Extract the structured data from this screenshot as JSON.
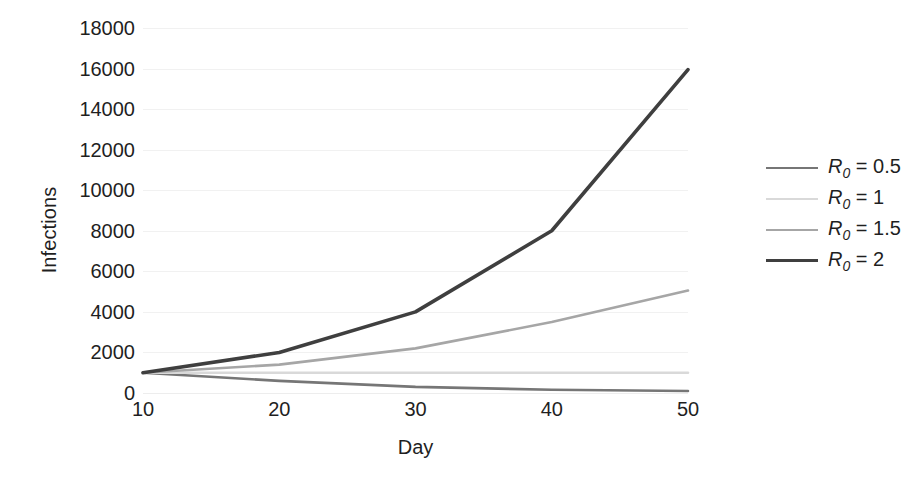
{
  "chart_data": {
    "type": "line",
    "title": "",
    "xlabel": "Day",
    "ylabel": "Infections",
    "x": [
      10,
      20,
      30,
      40,
      50
    ],
    "xlim": [
      10,
      50
    ],
    "ylim": [
      0,
      18000
    ],
    "x_ticks": [
      "10",
      "20",
      "30",
      "40",
      "50"
    ],
    "y_ticks": [
      "0",
      "2000",
      "4000",
      "6000",
      "8000",
      "10000",
      "12000",
      "14000",
      "16000",
      "18000"
    ],
    "y_tick_values": [
      0,
      2000,
      4000,
      6000,
      8000,
      10000,
      12000,
      14000,
      16000,
      18000
    ],
    "grid": true,
    "legend_position": "right",
    "series": [
      {
        "name": "R0 = 0.5",
        "label_prefix": "R",
        "label_sub": "0",
        "label_suffix": " = 0.5",
        "color": "#767676",
        "width": 2.6,
        "values": [
          1000,
          600,
          300,
          160,
          100
        ]
      },
      {
        "name": "R0 = 1",
        "label_prefix": "R",
        "label_sub": "0",
        "label_suffix": " = 1",
        "color": "#d9d9d9",
        "width": 2.6,
        "values": [
          1000,
          1000,
          1000,
          1000,
          1000
        ]
      },
      {
        "name": "R0 = 1.5",
        "label_prefix": "R",
        "label_sub": "0",
        "label_suffix": " = 1.5",
        "color": "#a6a6a6",
        "width": 2.6,
        "values": [
          1000,
          1400,
          2200,
          3500,
          5050
        ]
      },
      {
        "name": "R0 = 2",
        "label_prefix": "R",
        "label_sub": "0",
        "label_suffix": " = 2",
        "color": "#3f3f3f",
        "width": 3.6,
        "values": [
          1000,
          2000,
          4000,
          8000,
          15950
        ]
      }
    ]
  }
}
